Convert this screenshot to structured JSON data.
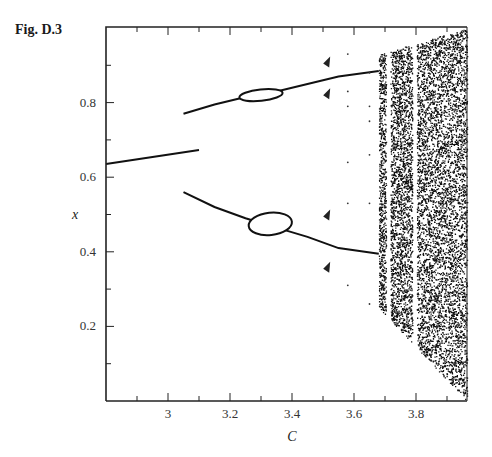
{
  "figure": {
    "label": "Fig. D.3"
  },
  "chart_data": {
    "type": "scatter",
    "title": "",
    "subtitle": "Bifurcation diagram",
    "xlabel": "C",
    "ylabel": "x",
    "xlim": [
      2.8,
      3.96
    ],
    "ylim": [
      0.0,
      1.0
    ],
    "grid": false,
    "legend": null,
    "x_ticks": [
      {
        "value": 3.0,
        "label": "3"
      },
      {
        "value": 3.2,
        "label": "3.2"
      },
      {
        "value": 3.4,
        "label": "3.4"
      },
      {
        "value": 3.6,
        "label": "3.6"
      },
      {
        "value": 3.8,
        "label": "3.8"
      }
    ],
    "x_minor_ticks": [
      2.9,
      3.1,
      3.3,
      3.5,
      3.7,
      3.9
    ],
    "y_ticks": [
      {
        "value": 0.2,
        "label": "0.2"
      },
      {
        "value": 0.4,
        "label": "0.4"
      },
      {
        "value": 0.6,
        "label": "0.6"
      },
      {
        "value": 0.8,
        "label": "0.8"
      }
    ],
    "y_minor_ticks": [
      0.1,
      0.3,
      0.5,
      0.7,
      0.9
    ],
    "series": [
      {
        "name": "fixed point",
        "style": "line",
        "points": [
          [
            2.8,
            0.635
          ],
          [
            3.1,
            0.673
          ]
        ]
      },
      {
        "name": "period-2 upper",
        "style": "line",
        "points": [
          [
            3.05,
            0.77
          ],
          [
            3.15,
            0.795
          ],
          [
            3.25,
            0.815
          ],
          [
            3.35,
            0.83
          ],
          [
            3.45,
            0.85
          ],
          [
            3.55,
            0.87
          ],
          [
            3.68,
            0.885
          ]
        ]
      },
      {
        "name": "period-2 lower",
        "style": "line",
        "points": [
          [
            3.05,
            0.56
          ],
          [
            3.15,
            0.52
          ],
          [
            3.25,
            0.49
          ],
          [
            3.35,
            0.465
          ],
          [
            3.45,
            0.44
          ],
          [
            3.55,
            0.41
          ],
          [
            3.68,
            0.395
          ]
        ]
      },
      {
        "name": "torus loop upper",
        "style": "ellipse",
        "center": [
          3.3,
          0.82
        ],
        "cx_halfwidth": 0.07,
        "cy_halfheight": 0.015
      },
      {
        "name": "torus loop lower",
        "style": "ellipse",
        "center": [
          3.33,
          0.475
        ],
        "cx_halfwidth": 0.07,
        "cy_halfheight": 0.03
      },
      {
        "name": "periodic windows / dots",
        "style": "markers",
        "points": [
          [
            3.52,
            0.91
          ],
          [
            3.52,
            0.825
          ],
          [
            3.52,
            0.5
          ],
          [
            3.52,
            0.36
          ],
          [
            3.58,
            0.93
          ],
          [
            3.58,
            0.83
          ],
          [
            3.58,
            0.79
          ],
          [
            3.58,
            0.64
          ],
          [
            3.58,
            0.53
          ],
          [
            3.58,
            0.31
          ],
          [
            3.65,
            0.88
          ],
          [
            3.65,
            0.79
          ],
          [
            3.65,
            0.75
          ],
          [
            3.65,
            0.66
          ],
          [
            3.65,
            0.53
          ],
          [
            3.65,
            0.26
          ]
        ]
      },
      {
        "name": "chaotic region",
        "style": "dense-scatter",
        "x_range": [
          3.68,
          3.96
        ],
        "upper_bound": [
          [
            3.68,
            0.93
          ],
          [
            3.96,
            1.0
          ]
        ],
        "lower_bound": [
          [
            3.68,
            0.25
          ],
          [
            3.96,
            0.0
          ]
        ],
        "gaps_at_C": [
          3.71,
          3.795
        ]
      }
    ]
  }
}
